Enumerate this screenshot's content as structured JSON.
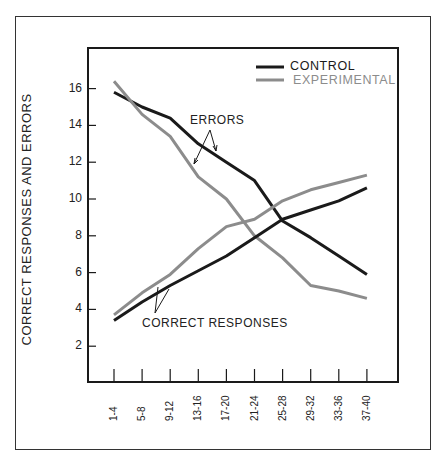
{
  "chart_data": {
    "type": "line",
    "title": "",
    "xlabel": "",
    "ylabel": "CORRECT RESPONSES AND ERRORS",
    "ylim": [
      0,
      18
    ],
    "yticks": [
      2,
      4,
      6,
      8,
      10,
      12,
      14,
      16
    ],
    "grid": false,
    "legend_position": "upper right",
    "categories": [
      "1-4",
      "5-8",
      "9-12",
      "13-16",
      "17-20",
      "21-24",
      "25-28",
      "29-32",
      "33-36",
      "37-40"
    ],
    "series": [
      {
        "name": "CONTROL (errors)",
        "group": "ERRORS",
        "color": "#1a1a1a",
        "values": [
          15.8,
          15.0,
          14.4,
          13.0,
          12.0,
          11.0,
          8.8,
          7.9,
          6.9,
          5.9
        ]
      },
      {
        "name": "EXPERIMENTAL (errors)",
        "group": "ERRORS",
        "color": "#8c8c8c",
        "values": [
          16.4,
          14.6,
          13.4,
          11.2,
          10.0,
          8.0,
          6.8,
          5.3,
          5.0,
          4.6
        ]
      },
      {
        "name": "CONTROL (correct responses)",
        "group": "CORRECT RESPONSES",
        "color": "#1a1a1a",
        "values": [
          3.4,
          4.4,
          5.3,
          6.1,
          6.9,
          7.9,
          8.9,
          9.4,
          9.9,
          10.6
        ]
      },
      {
        "name": "EXPERIMENTAL (correct responses)",
        "group": "CORRECT RESPONSES",
        "color": "#8c8c8c",
        "values": [
          3.7,
          4.9,
          5.9,
          7.3,
          8.5,
          8.9,
          9.9,
          10.5,
          10.9,
          11.3
        ]
      }
    ],
    "legend": [
      {
        "label": "CONTROL",
        "color": "#1a1a1a"
      },
      {
        "label": "EXPERIMENTAL",
        "color": "#8c8c8c"
      }
    ],
    "annotations": [
      "ERRORS",
      "CORRECT RESPONSES"
    ]
  },
  "labels": {
    "ylabel": "CORRECT RESPONSES AND ERRORS",
    "legend_control": "CONTROL",
    "legend_experimental": "EXPERIMENTAL",
    "annot_errors": "ERRORS",
    "annot_correct": "CORRECT RESPONSES"
  }
}
